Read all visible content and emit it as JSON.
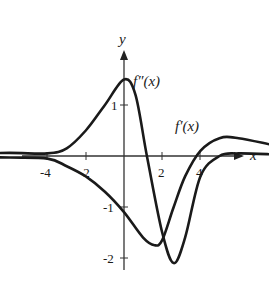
{
  "chart_data": {
    "type": "line",
    "title": "",
    "xlabel": "x",
    "ylabel": "y",
    "xlim": [
      -4.6,
      4.7
    ],
    "ylim": [
      -2.3,
      1.9
    ],
    "grid": false,
    "legend": "inline labels",
    "xticks": [
      -4,
      -2,
      2,
      4
    ],
    "xtick_labels": [
      "-4",
      "-2",
      "2",
      "4"
    ],
    "yticks": [
      1,
      -1,
      -2
    ],
    "ytick_labels": [
      "1",
      "-1",
      "-2"
    ],
    "series": [
      {
        "name": "f''(x)",
        "label": "f″(x)",
        "x": [
          -4.5,
          -3,
          -2,
          -1.5,
          -1,
          -0.5,
          0,
          0.3,
          0.6,
          1.0,
          1.3,
          1.6,
          2.0,
          2.5,
          3,
          4,
          4.5
        ],
        "y": [
          0.05,
          0.06,
          0.05,
          0.15,
          0.5,
          1.0,
          1.5,
          1.2,
          0.0,
          -1.5,
          -2.1,
          -1.6,
          -0.4,
          0.0,
          0.05,
          0.03,
          0.02
        ]
      },
      {
        "name": "f'(x)",
        "label": "f′(x)",
        "x": [
          -4.5,
          -3,
          -2,
          -1.5,
          -1,
          -0.5,
          0,
          0.5,
          0.8,
          1.0,
          1.3,
          1.6,
          2.0,
          2.5,
          3,
          4,
          4.5
        ],
        "y": [
          -0.02,
          -0.03,
          -0.05,
          -0.2,
          -0.4,
          -0.7,
          -1.1,
          -1.6,
          -1.75,
          -1.65,
          -1.0,
          -0.4,
          0.1,
          0.35,
          0.35,
          0.2,
          0.15
        ]
      }
    ],
    "annotations": [
      {
        "text": "f″(x)",
        "x": 0.3,
        "y": 1.55
      },
      {
        "text": "f′(x)",
        "x": 2.8,
        "y": 0.65
      }
    ]
  }
}
